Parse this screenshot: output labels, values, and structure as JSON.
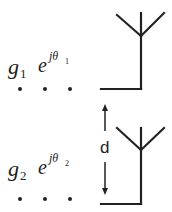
{
  "diagram": {
    "elements": [
      {
        "gain_symbol": "g",
        "gain_index": "1",
        "phase_base": "e",
        "phase_exponent": "jθ",
        "phase_index": "1",
        "dots": "• • •"
      },
      {
        "gain_symbol": "g",
        "gain_index": "2",
        "phase_base": "e",
        "phase_exponent": "jθ",
        "phase_index": "2",
        "dots": "• • •"
      }
    ],
    "spacing_label": "d",
    "colors": {
      "stroke": "#222222",
      "background": "#ffffff"
    }
  }
}
